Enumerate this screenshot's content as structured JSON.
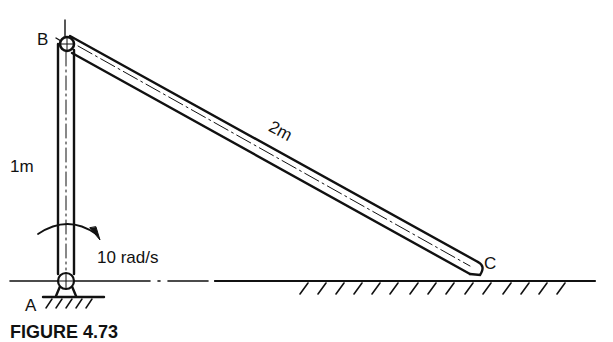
{
  "figure": {
    "caption": "FIGURE 4.73",
    "labels": {
      "point_a": "A",
      "point_b": "B",
      "point_c": "C",
      "link_ab_length": "1m",
      "link_bc_length": "2m",
      "angular_velocity": "10 rad/s"
    },
    "colors": {
      "ink": "#111111",
      "background": "#ffffff"
    }
  }
}
